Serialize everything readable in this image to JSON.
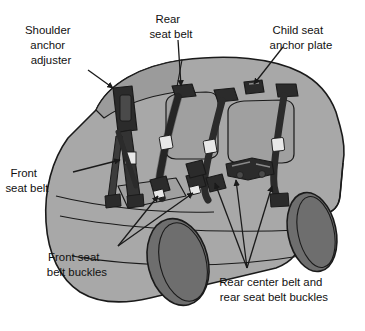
{
  "figure": {
    "kind": "technical-illustration",
    "background_color": "#ffffff"
  },
  "palette": {
    "body_fill": "#a8a8a8",
    "window_fill": "#9a9a9a",
    "seat_fill": "#a0a0a0",
    "wheel_fill": "#6e6e6e",
    "hardware_dark": "#2b2b2b",
    "hardware_mid": "#3c3c3c",
    "tongue_light": "#e8e8e8",
    "outline": "#1a1a1a",
    "text_color": "#111111",
    "leader_color": "#1a1a1a"
  },
  "labels": [
    {
      "id": "shoulder-anchor-adjuster",
      "lines": [
        "Shoulder",
        "anchor",
        "adjuster"
      ],
      "text_x": 62,
      "text_y": 31,
      "line_height": 15,
      "leader": {
        "from_x": 88,
        "from_y": 70,
        "to_x": 113,
        "to_y": 88,
        "arrow": true
      }
    },
    {
      "id": "rear-seat-belt",
      "lines": [
        "Rear",
        "seat belt"
      ],
      "text_x": 182,
      "text_y": 20,
      "line_height": 15,
      "leader": {
        "from_x": 178,
        "from_y": 40,
        "to_x": 181,
        "to_y": 86,
        "arrow": true
      }
    },
    {
      "id": "child-seat-anchor-plate",
      "lines": [
        "Child seat",
        "anchor plate"
      ],
      "text_x": 312,
      "text_y": 31,
      "line_height": 15,
      "leader": {
        "from_x": 283,
        "from_y": 47,
        "to_x": 254,
        "to_y": 84,
        "arrow": true
      }
    },
    {
      "id": "front-seat-belt",
      "lines": [
        "Front",
        "seat belt"
      ],
      "text_x": 38,
      "text_y": 174,
      "line_height": 15,
      "leader": {
        "from_x": 73,
        "from_y": 172,
        "to_x": 120,
        "to_y": 160,
        "arrow": true
      }
    },
    {
      "id": "front-seat-belt-buckles",
      "lines": [
        "Front seat",
        "belt buckles"
      ],
      "text_x": 88,
      "text_y": 258,
      "line_height": 15,
      "leaders": [
        {
          "from_x": 118,
          "from_y": 246,
          "to_x": 158,
          "to_y": 196,
          "arrow": true
        },
        {
          "from_x": 118,
          "from_y": 246,
          "to_x": 193,
          "to_y": 193,
          "arrow": true
        }
      ]
    },
    {
      "id": "rear-center-belt-and-rear-seat-belt-buckles",
      "lines": [
        "Rear center belt and",
        "rear seat belt buckles"
      ],
      "text_x": 285,
      "text_y": 283,
      "line_height": 15,
      "leaders": [
        {
          "from_x": 247,
          "from_y": 268,
          "to_x": 215,
          "to_y": 183,
          "arrow": true
        },
        {
          "from_x": 247,
          "from_y": 268,
          "to_x": 236,
          "to_y": 180,
          "arrow": true
        },
        {
          "from_x": 247,
          "from_y": 268,
          "to_x": 272,
          "to_y": 186,
          "arrow": true
        }
      ]
    }
  ],
  "components": [
    {
      "id": "shoulder-anchor-adjuster-part",
      "description": "B-pillar height adjuster track"
    },
    {
      "id": "front-seat-belt-webbing",
      "description": "front shoulder belt webbing"
    },
    {
      "id": "rear-seat-belt-left",
      "description": "second row shoulder belt"
    },
    {
      "id": "rear-seat-belt-right",
      "description": "third row shoulder belt"
    },
    {
      "id": "child-seat-anchor-plate-part",
      "description": "roof mounted child seat tether anchor"
    },
    {
      "id": "front-buckle-left",
      "description": "front seat belt buckle"
    },
    {
      "id": "front-buckle-right",
      "description": "front seat belt buckle"
    },
    {
      "id": "rear-center-belt-part",
      "description": "rear center belt stowed assembly"
    },
    {
      "id": "rear-buckle-left",
      "description": "rear seat belt buckle"
    },
    {
      "id": "rear-buckle-right",
      "description": "rear seat belt buckle"
    },
    {
      "id": "front-wheel",
      "description": "front road wheel"
    },
    {
      "id": "rear-wheel",
      "description": "rear road wheel"
    }
  ]
}
